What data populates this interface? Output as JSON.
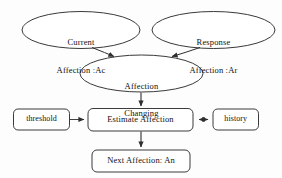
{
  "diagram": {
    "style": {
      "background": "#fdfdfd",
      "stroke": "#3a3a3a",
      "text": "#111111",
      "fill": "#ffffff"
    },
    "nodes": [
      {
        "id": "current-affection",
        "shape": "ellipse",
        "line1": "Current",
        "line2": "Affection :Ac"
      },
      {
        "id": "response-affection",
        "shape": "ellipse",
        "line1": "Response",
        "line2": "Affection :Ar"
      },
      {
        "id": "affection-changing",
        "shape": "ellipse",
        "line1": "Affection",
        "line2": "Changing"
      },
      {
        "id": "threshold",
        "shape": "rounded-box",
        "label": "threshold"
      },
      {
        "id": "estimate-affection",
        "shape": "rounded-box",
        "label": "Estimate Affection"
      },
      {
        "id": "history",
        "shape": "rounded-box",
        "label": "history"
      },
      {
        "id": "next-affection",
        "shape": "rounded-box",
        "label": "Next Affection: An"
      }
    ],
    "edges": [
      {
        "id": "edge-current-to-changing",
        "from": "current-affection",
        "to": "affection-changing",
        "arrow": "single"
      },
      {
        "id": "edge-response-to-changing",
        "from": "response-affection",
        "to": "affection-changing",
        "arrow": "single"
      },
      {
        "id": "edge-changing-to-estimate",
        "from": "affection-changing",
        "to": "estimate-affection",
        "arrow": "single"
      },
      {
        "id": "edge-threshold-to-estimate",
        "from": "threshold",
        "to": "estimate-affection",
        "arrow": "single"
      },
      {
        "id": "edge-estimate-history",
        "from": "estimate-affection",
        "to": "history",
        "arrow": "double"
      },
      {
        "id": "edge-estimate-to-next",
        "from": "estimate-affection",
        "to": "next-affection",
        "arrow": "single"
      }
    ]
  }
}
